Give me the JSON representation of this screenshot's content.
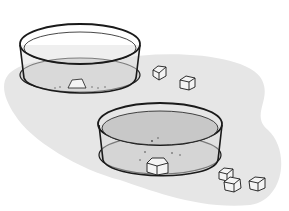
{
  "scene": {
    "description": "Illustration of two shallow glass dishes containing liquid; one has a dissolving cube, the other a whole cube, with loose cubes on the surface",
    "colors": {
      "background": "#ffffff",
      "surface": "#e4e4e4",
      "liquid": "#cfcfcf",
      "outline": "#1a1a1a",
      "cube": "#f4f4f4"
    },
    "dishes": [
      {
        "name": "upper-dish",
        "contents": "partially dissolved cube"
      },
      {
        "name": "lower-dish",
        "contents": "whole cube with particles"
      }
    ],
    "loose_cubes": 5
  }
}
